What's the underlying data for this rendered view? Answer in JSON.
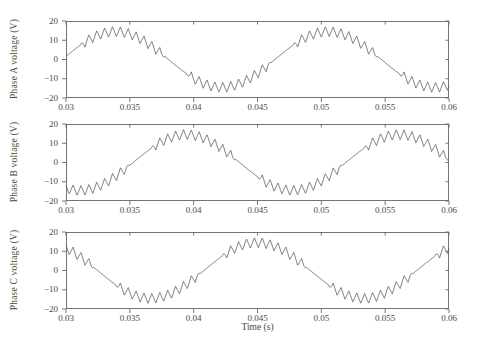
{
  "figure": {
    "background": "#ffffff",
    "line_color": "#585858",
    "axis_color": "#6a665c",
    "text_color": "#4e4940"
  },
  "chart_data": {
    "type": "line",
    "grid": false,
    "legend": false,
    "x": {
      "label": "Time (s)",
      "range": [
        0.03,
        0.06
      ],
      "ticks": [
        0.03,
        0.035,
        0.04,
        0.045,
        0.05,
        0.055,
        0.06
      ],
      "tick_labels": [
        "0.03",
        "0.035",
        "0.04",
        "0.045",
        "0.05",
        "0.055",
        "0.06"
      ]
    },
    "y": {
      "range": [
        -20,
        20
      ],
      "ticks": [
        -20,
        -10,
        0,
        10,
        20
      ],
      "tick_labels_top_to_bottom": [
        "20",
        "10",
        "0",
        "−10",
        "−20"
      ]
    },
    "subplots": [
      {
        "id": "phase-a",
        "ylabel": "Phase A voltage (V)",
        "phase_deg": 0,
        "rising_zero_crossing_s": 0.0297
      },
      {
        "id": "phase-b",
        "ylabel": "Phase B voltage (V)",
        "phase_deg": -120,
        "rising_zero_crossing_s": 0.03526
      },
      {
        "id": "phase-c",
        "ylabel": "Phase C voltage (V)",
        "phase_deg": 120,
        "rising_zero_crossing_s": 0.02414
      }
    ],
    "signal_model": {
      "fundamental_frequency_hz": 60,
      "fundamental_amplitude_v": 14.5,
      "ripple_shape": "triangle",
      "ripple_frequency_hz": 1620,
      "ripple_amplitude_v": 2.6,
      "ripple_suppressed_near_zero_crossing_deg_before": 6,
      "ripple_suppressed_after_zero_crossing_deg": 30,
      "ripple_ramp_deg": 8,
      "peak_voltage_v": 17,
      "trough_voltage_v": -17
    }
  }
}
